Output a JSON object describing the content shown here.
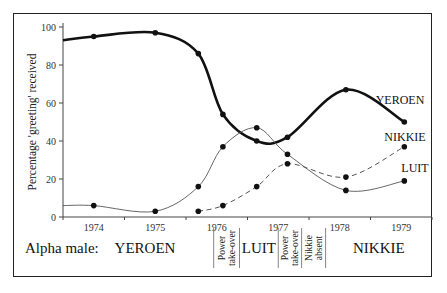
{
  "chart_data": {
    "type": "line",
    "title": "",
    "xlabel": "",
    "ylabel": "Percentage 'greeting' received",
    "xlim": [
      1974.0,
      1980.0
    ],
    "ylim": [
      0,
      100
    ],
    "yticks": [
      0,
      20,
      40,
      60,
      80,
      100
    ],
    "year_labels": [
      "1974",
      "1975",
      "1976",
      "1977",
      "1978",
      "1979"
    ],
    "grid": false,
    "legend": "inline labels at right end of each line",
    "series": [
      {
        "name": "YEROEN",
        "style": "thick-solid",
        "points": [
          {
            "x": 1974.0,
            "y": 93,
            "marker": false
          },
          {
            "x": 1974.5,
            "y": 95,
            "marker": true
          },
          {
            "x": 1975.5,
            "y": 97,
            "marker": true
          },
          {
            "x": 1976.2,
            "y": 86,
            "marker": true
          },
          {
            "x": 1976.6,
            "y": 54,
            "marker": true
          },
          {
            "x": 1977.15,
            "y": 40,
            "marker": true
          },
          {
            "x": 1977.65,
            "y": 42,
            "marker": true
          },
          {
            "x": 1978.6,
            "y": 67,
            "marker": true
          },
          {
            "x": 1979.55,
            "y": 50,
            "marker": true
          }
        ]
      },
      {
        "name": "LUIT",
        "style": "thin-solid",
        "points": [
          {
            "x": 1974.0,
            "y": 6,
            "marker": false
          },
          {
            "x": 1974.5,
            "y": 6,
            "marker": true
          },
          {
            "x": 1975.5,
            "y": 3,
            "marker": true
          },
          {
            "x": 1976.2,
            "y": 16,
            "marker": true
          },
          {
            "x": 1976.6,
            "y": 37,
            "marker": true
          },
          {
            "x": 1977.15,
            "y": 47,
            "marker": true
          },
          {
            "x": 1977.65,
            "y": 33,
            "marker": true
          },
          {
            "x": 1978.6,
            "y": 14,
            "marker": true
          },
          {
            "x": 1979.55,
            "y": 19,
            "marker": true
          }
        ]
      },
      {
        "name": "NIKKIE",
        "style": "dashed",
        "points": [
          {
            "x": 1976.2,
            "y": 3,
            "marker": true
          },
          {
            "x": 1976.6,
            "y": 6,
            "marker": true
          },
          {
            "x": 1977.15,
            "y": 16,
            "marker": true
          },
          {
            "x": 1977.65,
            "y": 28,
            "marker": true
          },
          {
            "x": 1978.6,
            "y": 21,
            "marker": true
          },
          {
            "x": 1979.55,
            "y": 37,
            "marker": true
          }
        ]
      }
    ],
    "series_labels": [
      "YEROEN",
      "NIKKIE",
      "LUIT"
    ],
    "alpha_male_row": {
      "label": "Alpha male:",
      "periods": [
        {
          "text": "YEROEN",
          "from": 1974.0,
          "to": 1976.45
        },
        {
          "text": "Power take-over",
          "from": 1976.45,
          "to": 1976.87,
          "rotated": true
        },
        {
          "text": "LUIT",
          "from": 1976.87,
          "to": 1977.5
        },
        {
          "text": "Power take-over",
          "from": 1977.5,
          "to": 1977.88,
          "rotated": true
        },
        {
          "text": "Nikkie absent",
          "from": 1977.88,
          "to": 1978.27,
          "rotated": true
        },
        {
          "text": "NIKKIE",
          "from": 1978.27,
          "to": 1980.0
        }
      ]
    }
  }
}
